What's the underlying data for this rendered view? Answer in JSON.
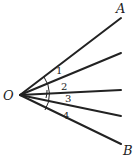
{
  "diagram": {
    "type": "geometry-angles",
    "vertex": {
      "label": "O",
      "x": 20,
      "y": 95
    },
    "rays": [
      {
        "name": "OA",
        "end": [
          121,
          18
        ],
        "label": "A",
        "label_pos": [
          118,
          11
        ]
      },
      {
        "name": "ray-2",
        "end": [
          121,
          53
        ]
      },
      {
        "name": "ray-3",
        "end": [
          121,
          90
        ]
      },
      {
        "name": "ray-4",
        "end": [
          121,
          116
        ]
      },
      {
        "name": "OB",
        "end": [
          121,
          144
        ],
        "label": "B",
        "label_pos": [
          123,
          153
        ]
      }
    ],
    "angles": [
      {
        "label": "1",
        "pos": [
          57,
          73
        ]
      },
      {
        "label": "2",
        "pos": [
          62,
          89
        ]
      },
      {
        "label": "3",
        "pos": [
          66,
          101
        ]
      },
      {
        "label": "4",
        "pos": [
          64,
          117
        ]
      }
    ],
    "color": "#222222"
  }
}
